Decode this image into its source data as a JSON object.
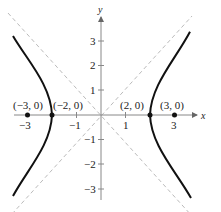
{
  "figure": {
    "type": "hyperbola",
    "equation_hint": "x^2/4 - y^2/5 = 1",
    "axes": {
      "x_label": "x",
      "y_label": "y",
      "x_ticks": [
        "−3",
        "−1",
        "1",
        "3"
      ],
      "y_ticks": [
        "3",
        "2",
        "1",
        "−1",
        "−2",
        "−3"
      ]
    },
    "points": [
      {
        "label": "(−3, 0)"
      },
      {
        "label": "(−2, 0)"
      },
      {
        "label": "(2, 0)"
      },
      {
        "label": "(3, 0)"
      }
    ],
    "colors": {
      "curve": "#111111",
      "axis": "#888888",
      "asymptote": "#bbbbbb"
    }
  }
}
